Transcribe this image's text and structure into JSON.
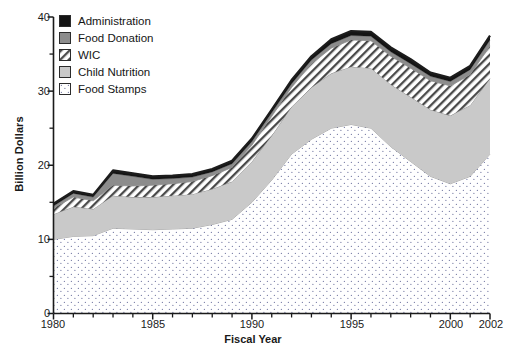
{
  "chart_data": {
    "type": "area",
    "stacked": true,
    "title": "",
    "xlabel": "Fiscal Year",
    "ylabel": "Billion Dollars",
    "xlim": [
      1980,
      2002
    ],
    "ylim": [
      0,
      40
    ],
    "grid": false,
    "legend_position": "top-left",
    "x": [
      1980,
      1981,
      1982,
      1983,
      1984,
      1985,
      1986,
      1987,
      1988,
      1989,
      1990,
      1991,
      1992,
      1993,
      1994,
      1995,
      1996,
      1997,
      1998,
      1999,
      2000,
      2001,
      2002
    ],
    "xticks_major": [
      1980,
      1985,
      1990,
      1995,
      2000,
      2002
    ],
    "xticks_minor_interval": 1,
    "yticks_major": [
      0,
      10,
      20,
      30,
      40
    ],
    "yticks_minor": [
      5,
      15,
      25,
      35
    ],
    "series": [
      {
        "name": "Food Stamps",
        "pattern": "dotted",
        "color": "#ffffff",
        "values": [
          10.0,
          10.4,
          10.5,
          11.5,
          11.4,
          11.3,
          11.4,
          11.5,
          12.0,
          12.7,
          15.0,
          18.0,
          21.5,
          23.5,
          25.0,
          25.5,
          25.0,
          22.5,
          20.5,
          18.5,
          17.5,
          18.5,
          21.5
        ]
      },
      {
        "name": "Child Nutrition",
        "pattern": "solid-light",
        "color": "#c9c9c9",
        "values": [
          3.4,
          4.0,
          3.6,
          4.4,
          4.3,
          4.4,
          4.5,
          4.6,
          4.8,
          5.1,
          5.5,
          6.0,
          6.4,
          7.0,
          7.4,
          7.8,
          8.1,
          8.4,
          8.7,
          9.0,
          9.2,
          9.6,
          10.2
        ]
      },
      {
        "name": "WIC",
        "pattern": "hatch",
        "color": "#ffffff",
        "values": [
          0.8,
          1.3,
          1.1,
          1.4,
          1.5,
          1.6,
          1.6,
          1.7,
          1.8,
          1.9,
          2.2,
          2.6,
          2.6,
          3.2,
          3.4,
          3.6,
          3.7,
          3.8,
          3.9,
          3.9,
          4.0,
          4.1,
          4.4
        ]
      },
      {
        "name": "Food Donation",
        "pattern": "solid-dark",
        "color": "#8c8c8c",
        "values": [
          0.3,
          0.5,
          0.5,
          1.6,
          1.3,
          0.8,
          0.7,
          0.6,
          0.5,
          0.5,
          0.5,
          0.5,
          0.5,
          0.5,
          0.6,
          0.6,
          0.6,
          0.6,
          0.6,
          0.6,
          0.6,
          0.7,
          0.8
        ]
      },
      {
        "name": "Administration",
        "pattern": "solid-black",
        "color": "#141414",
        "values": [
          0.3,
          0.3,
          0.3,
          0.4,
          0.4,
          0.4,
          0.4,
          0.4,
          0.4,
          0.4,
          0.4,
          0.4,
          0.5,
          0.5,
          0.6,
          0.6,
          0.6,
          0.6,
          0.6,
          0.5,
          0.5,
          0.5,
          0.6
        ]
      }
    ],
    "totals": [
      14.8,
      16.5,
      16.0,
      19.3,
      18.9,
      18.5,
      18.6,
      18.8,
      19.5,
      20.6,
      23.6,
      27.5,
      31.5,
      34.7,
      37.0,
      38.1,
      38.0,
      35.9,
      34.3,
      32.5,
      31.8,
      33.4,
      37.5
    ]
  },
  "legend": {
    "items": [
      {
        "label": "Administration",
        "icon": "black-square-swatch"
      },
      {
        "label": "Food Donation",
        "icon": "dark-gray-square-swatch"
      },
      {
        "label": "WIC",
        "icon": "hatched-square-swatch"
      },
      {
        "label": "Child Nutrition",
        "icon": "light-gray-square-swatch"
      },
      {
        "label": "Food Stamps",
        "icon": "dotted-square-swatch"
      }
    ]
  },
  "axes": {
    "y_title": "Billion Dollars",
    "x_title": "Fiscal Year",
    "y_tick_labels": [
      "0",
      "10",
      "20",
      "30",
      "40"
    ],
    "x_tick_labels": [
      "1980",
      "1985",
      "1990",
      "1995",
      "2000",
      "2002"
    ]
  },
  "colors": {
    "administration": "#141414",
    "food_donation": "#8c8c8c",
    "wic": "#ffffff",
    "child_nutrition": "#c9c9c9",
    "food_stamps": "#ffffff",
    "axis": "#1a1a1a",
    "outline": "#1c1c1c"
  }
}
